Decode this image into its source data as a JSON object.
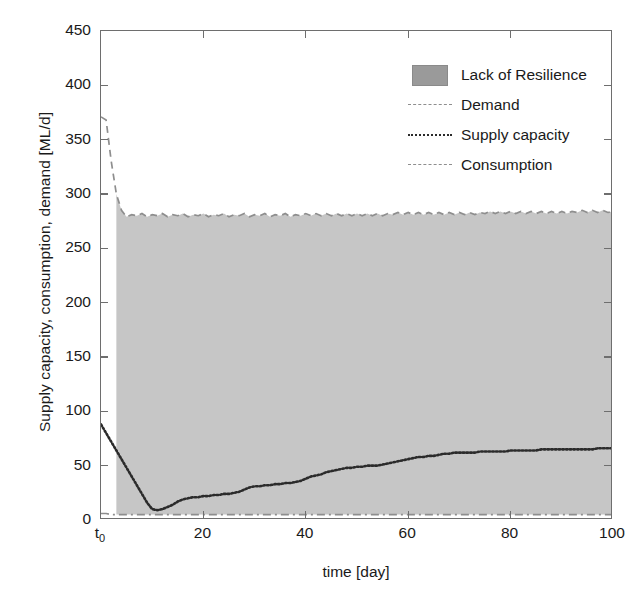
{
  "chart_data": {
    "type": "area",
    "title": "",
    "xlabel": "time [day]",
    "ylabel": "Supply capacity, consumption, demand [ML/d]",
    "xlim": [
      0,
      100
    ],
    "ylim": [
      0,
      450
    ],
    "xticks": [
      0,
      20,
      40,
      60,
      80,
      100
    ],
    "xticklabels": [
      "t₀",
      "20",
      "40",
      "60",
      "80",
      "100"
    ],
    "yticks": [
      0,
      50,
      100,
      150,
      200,
      250,
      300,
      350,
      400,
      450
    ],
    "yticklabels": [
      "0",
      "50",
      "100",
      "150",
      "200",
      "250",
      "300",
      "350",
      "400",
      "450"
    ],
    "grid": false,
    "legend_position": "upper right",
    "colors": {
      "fill": "#c6c6c6",
      "legend_swatch": "#9a9a9a",
      "demand": "#8e8e8e",
      "supply": "#2b2b2b",
      "consumption": "#8e8e8e",
      "axis": "#6e6e6e",
      "background": "#ffffff"
    },
    "legend": [
      {
        "label": "Lack of Resilience",
        "style": "patch"
      },
      {
        "label": "Demand",
        "style": "dashed"
      },
      {
        "label": "Supply capacity",
        "style": "dotted"
      },
      {
        "label": "Consumption",
        "style": "dashdot"
      }
    ],
    "x": [
      0,
      1,
      2,
      3,
      4,
      5,
      6,
      7,
      8,
      9,
      10,
      11,
      12,
      13,
      14,
      15,
      16,
      17,
      18,
      19,
      20,
      21,
      22,
      23,
      24,
      25,
      26,
      27,
      28,
      29,
      30,
      31,
      32,
      33,
      34,
      35,
      36,
      37,
      38,
      39,
      40,
      41,
      42,
      43,
      44,
      45,
      46,
      47,
      48,
      49,
      50,
      51,
      52,
      53,
      54,
      55,
      56,
      57,
      58,
      59,
      60,
      61,
      62,
      63,
      64,
      65,
      66,
      67,
      68,
      69,
      70,
      71,
      72,
      73,
      74,
      75,
      76,
      77,
      78,
      79,
      80,
      81,
      82,
      83,
      84,
      85,
      86,
      87,
      88,
      89,
      90,
      91,
      92,
      93,
      94,
      95,
      96,
      97,
      98,
      99,
      100
    ],
    "series": [
      {
        "name": "Demand",
        "style": "dashed",
        "values": [
          371,
          368,
          330,
          300,
          285,
          279,
          281,
          280,
          282,
          279,
          281,
          280,
          282,
          279,
          281,
          280,
          282,
          279,
          281,
          280,
          282,
          279,
          281,
          280,
          282,
          279,
          281,
          280,
          282,
          279,
          281,
          280,
          282,
          279,
          281,
          280,
          282,
          279,
          281,
          280,
          282,
          280,
          282,
          280,
          282,
          280,
          282,
          280,
          282,
          280,
          282,
          280,
          282,
          280,
          282,
          280,
          282,
          281,
          283,
          281,
          283,
          281,
          283,
          281,
          283,
          281,
          283,
          281,
          283,
          281,
          283,
          281,
          283,
          281,
          283,
          282,
          284,
          282,
          284,
          282,
          284,
          282,
          284,
          282,
          284,
          282,
          284,
          282,
          284,
          282,
          284,
          282,
          284,
          283,
          285,
          283,
          285,
          283,
          285,
          283,
          284
        ]
      },
      {
        "name": "Supply capacity",
        "style": "dotted",
        "values": [
          88,
          80,
          72,
          64,
          56,
          48,
          40,
          32,
          24,
          16,
          10,
          9,
          10,
          12,
          14,
          17,
          19,
          20,
          21,
          21,
          22,
          22,
          23,
          23,
          24,
          24,
          25,
          26,
          28,
          30,
          31,
          31,
          32,
          32,
          33,
          33,
          34,
          34,
          35,
          36,
          38,
          40,
          41,
          42,
          44,
          45,
          46,
          47,
          48,
          48,
          49,
          49,
          50,
          50,
          50,
          51,
          52,
          53,
          54,
          55,
          56,
          57,
          58,
          58,
          59,
          59,
          60,
          61,
          61,
          62,
          62,
          62,
          62,
          62,
          63,
          63,
          63,
          63,
          63,
          63,
          64,
          64,
          64,
          64,
          64,
          64,
          65,
          65,
          65,
          65,
          65,
          65,
          65,
          65,
          65,
          65,
          65,
          66,
          66,
          66,
          66
        ]
      },
      {
        "name": "Consumption",
        "style": "dashdot",
        "values": [
          6,
          6,
          5,
          5,
          5,
          5,
          5,
          5,
          5,
          5,
          5,
          5,
          5,
          5,
          5,
          5,
          5,
          5,
          5,
          5,
          5,
          5,
          5,
          5,
          5,
          5,
          5,
          5,
          5,
          5,
          5,
          5,
          5,
          5,
          5,
          5,
          5,
          5,
          5,
          5,
          5,
          5,
          5,
          5,
          5,
          5,
          5,
          5,
          5,
          5,
          5,
          5,
          5,
          5,
          5,
          5,
          5,
          5,
          5,
          5,
          5,
          5,
          5,
          5,
          5,
          5,
          5,
          5,
          5,
          5,
          5,
          5,
          5,
          5,
          5,
          5,
          5,
          5,
          5,
          5,
          5,
          5,
          5,
          5,
          5,
          5,
          5,
          5,
          5,
          5,
          5,
          5,
          5,
          5,
          5,
          5,
          5,
          5,
          5,
          5,
          5
        ]
      }
    ],
    "fill_band": {
      "name": "Lack of Resilience",
      "between": [
        "Consumption",
        "Demand"
      ],
      "description": "Shaded area between consumption and demand representing the resilience gap"
    }
  }
}
